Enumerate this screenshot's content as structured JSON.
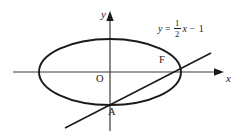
{
  "figure": {
    "type": "geometry-diagram",
    "background_color": "#ffffff",
    "stroke_color": "#1a1a1a",
    "axes": {
      "x_axis_label": "x",
      "y_axis_label": "y",
      "origin_label": "O",
      "x_axis_y_px": 72,
      "y_axis_x_px": 110,
      "x_axis_start_px": 13,
      "x_axis_end_px": 224,
      "y_axis_top_px": 12,
      "y_axis_bottom_px": 131
    },
    "ellipse": {
      "center_x_px": 110,
      "center_y_px": 72,
      "radius_x_px": 71,
      "radius_y_px": 33
    },
    "line": {
      "equation_text": "y = 1/2 x - 1",
      "equation_lhs": "y",
      "equation_equals": "=",
      "equation_numerator": "1",
      "equation_denominator": "2",
      "equation_var": "x",
      "equation_minus": "−",
      "equation_constant": "1",
      "slope": 0.5,
      "intercept": -1,
      "start_x_px": 65,
      "start_y_px": 128,
      "end_x_px": 211,
      "end_y_px": 53
    },
    "points": [
      {
        "name": "point-f",
        "label": "F",
        "x_px": 163,
        "y_px": 63
      },
      {
        "name": "point-a",
        "label": "A",
        "x_px": 112,
        "y_px": 113
      }
    ]
  }
}
